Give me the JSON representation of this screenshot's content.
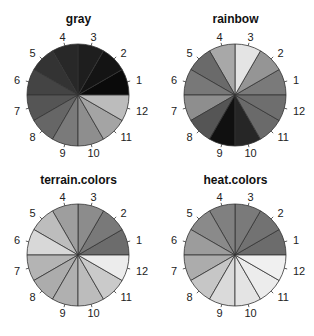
{
  "chart_data": [
    {
      "type": "pie",
      "title": "gray",
      "categories": [
        "1",
        "2",
        "3",
        "4",
        "5",
        "6",
        "7",
        "8",
        "9",
        "10",
        "11",
        "12"
      ],
      "values": [
        1,
        1,
        1,
        1,
        1,
        1,
        1,
        1,
        1,
        1,
        1,
        1
      ],
      "colors": [
        "#0a0a0a",
        "#141414",
        "#1e1e1e",
        "#282828",
        "#333333",
        "#444444",
        "#555555",
        "#666666",
        "#7a7a7a",
        "#8e8e8e",
        "#a4a4a4",
        "#bcbcbc"
      ],
      "start_angle_deg": 0,
      "direction": "counterclockwise"
    },
    {
      "type": "pie",
      "title": "rainbow",
      "categories": [
        "1",
        "2",
        "3",
        "4",
        "5",
        "6",
        "7",
        "8",
        "9",
        "10",
        "11",
        "12"
      ],
      "values": [
        1,
        1,
        1,
        1,
        1,
        1,
        1,
        1,
        1,
        1,
        1,
        1
      ],
      "colors": [
        "#7a7a7a",
        "#959595",
        "#e4e4e4",
        "#a8a8a8",
        "#6a6a6a",
        "#787878",
        "#8e8e8e",
        "#555555",
        "#101010",
        "#262626",
        "#6a6a6a",
        "#6e6e6e"
      ],
      "start_angle_deg": 0,
      "direction": "counterclockwise"
    },
    {
      "type": "pie",
      "title": "terrain.colors",
      "categories": [
        "1",
        "2",
        "3",
        "4",
        "5",
        "6",
        "7",
        "8",
        "9",
        "10",
        "11",
        "12"
      ],
      "values": [
        1,
        1,
        1,
        1,
        1,
        1,
        1,
        1,
        1,
        1,
        1,
        1
      ],
      "colors": [
        "#6c6c6c",
        "#797979",
        "#8c8c8c",
        "#9e9e9e",
        "#bdbdbd",
        "#d8d8d8",
        "#b4b4b4",
        "#acacac",
        "#b0b0b0",
        "#bcbcbc",
        "#cacaca",
        "#ececec"
      ],
      "start_angle_deg": 0,
      "direction": "counterclockwise"
    },
    {
      "type": "pie",
      "title": "heat.colors",
      "categories": [
        "1",
        "2",
        "3",
        "4",
        "5",
        "6",
        "7",
        "8",
        "9",
        "10",
        "11",
        "12"
      ],
      "values": [
        1,
        1,
        1,
        1,
        1,
        1,
        1,
        1,
        1,
        1,
        1,
        1
      ],
      "colors": [
        "#6c6c6c",
        "#727272",
        "#7a7a7a",
        "#808080",
        "#8a8a8a",
        "#9c9c9c",
        "#acacac",
        "#c6c6c6",
        "#dadada",
        "#e4e4e4",
        "#ececec",
        "#f0f0f0"
      ],
      "start_angle_deg": 0,
      "direction": "counterclockwise"
    }
  ]
}
